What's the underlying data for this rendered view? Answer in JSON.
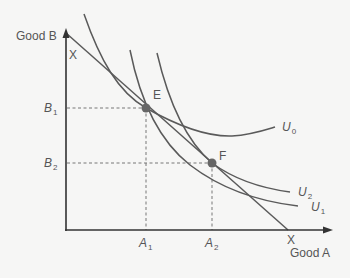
{
  "diagram": {
    "type": "indifference-curve-budget-line",
    "axes": {
      "y_label": "Good B",
      "x_label": "Good A"
    },
    "intercepts": {
      "y_intercept_label": "X",
      "x_intercept_label": "X"
    },
    "points": [
      {
        "id": "E",
        "label": "E",
        "a_label": "A",
        "a_sub": "1",
        "b_label": "B",
        "b_sub": "1"
      },
      {
        "id": "F",
        "label": "F",
        "a_label": "A",
        "a_sub": "2",
        "b_label": "B",
        "b_sub": "2"
      }
    ],
    "curves": [
      {
        "id": "U0",
        "label": "U",
        "sub": "0"
      },
      {
        "id": "U2",
        "label": "U",
        "sub": "2"
      },
      {
        "id": "U1",
        "label": "U",
        "sub": "1"
      }
    ],
    "colors": {
      "background": "#f6f6f5",
      "curve": "#5a5a5a",
      "axis": "#333333",
      "point": "#666666",
      "guide": "#777777",
      "text": "#555555"
    }
  }
}
